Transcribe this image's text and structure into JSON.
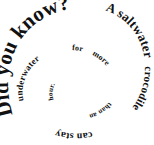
{
  "canvas": {
    "width": 154,
    "height": 145,
    "background_color": "#ffffff"
  },
  "graphic": {
    "type": "spiral-text",
    "text_color": "#111111",
    "full_text": "Did you know? A saltwater crocodile can stay underwater for more than an hour.",
    "direction": "inward-clockwise",
    "segments": [
      {
        "text": "Did you know?",
        "font_size": 21
      },
      {
        "text": "A saltwater",
        "font_size": 13
      },
      {
        "text": "crocodile",
        "font_size": 11
      },
      {
        "text": "can stay",
        "font_size": 10
      },
      {
        "text": "underwater",
        "font_size": 9
      },
      {
        "text": "for",
        "font_size": 8
      },
      {
        "text": "more",
        "font_size": 8
      },
      {
        "text": "than an",
        "font_size": 7
      },
      {
        "text": "hour.",
        "font_size": 7
      }
    ]
  }
}
